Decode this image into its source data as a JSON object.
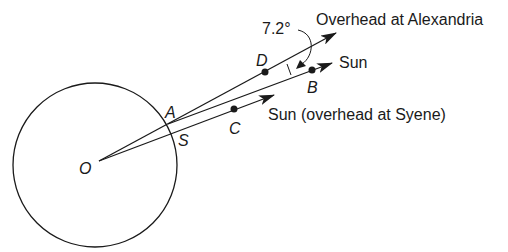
{
  "diagram": {
    "points": {
      "O": "O",
      "A": "A",
      "S": "S",
      "C": "C",
      "D": "D",
      "B": "B"
    },
    "angle_label": "7.2°",
    "captions": {
      "overhead_alexandria": "Overhead at Alexandria",
      "sun": "Sun",
      "sun_syene": "Sun (overhead at Syene)"
    },
    "colors": {
      "stroke": "#1a1a1a",
      "background": "#ffffff"
    }
  }
}
